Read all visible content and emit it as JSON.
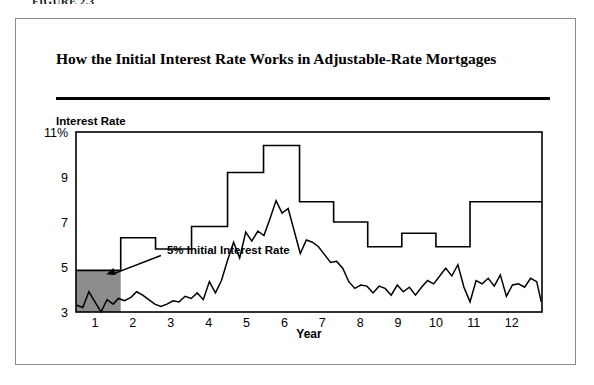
{
  "figure": {
    "caption": "FIGURE 2.3",
    "title": "How the Initial Interest Rate Works in Adjustable-Rate Mortgages",
    "frame_color": "#8a8a8a",
    "rule_color": "#000000"
  },
  "axes": {
    "y_title": "Interest Rate",
    "x_title": "Year",
    "y_ticks": [
      "11%",
      "9",
      "7",
      "5",
      "3"
    ],
    "x_ticks": [
      "1",
      "2",
      "3",
      "4",
      "5",
      "6",
      "7",
      "8",
      "9",
      "10",
      "11",
      "12"
    ]
  },
  "annotation": {
    "label": "5% Initial Interest Rate",
    "shade_color": "#8c8c8c",
    "arrow_color": "#000000"
  },
  "chart_data": {
    "type": "line",
    "title": "How the Initial Interest Rate Works in Adjustable-Rate Mortgages",
    "xlabel": "Year",
    "ylabel": "Interest Rate",
    "xlim": [
      0.5,
      12.8
    ],
    "ylim": [
      3,
      11
    ],
    "grid": false,
    "legend": null,
    "y_tick_values": [
      11,
      9,
      7,
      5,
      3
    ],
    "x_tick_values": [
      1,
      2,
      3,
      4,
      5,
      6,
      7,
      8,
      9,
      10,
      11,
      12
    ],
    "annotations": [
      {
        "text": "5% Initial Interest Rate",
        "x": 2.9,
        "y": 5.6,
        "arrow_to_x": 1.3,
        "arrow_to_y": 4.75
      }
    ],
    "shaded_region": {
      "label": "5% Initial Interest Rate period",
      "x_from": 0.5,
      "x_to": 1.68,
      "y_from": 3.0,
      "y_to": 4.85,
      "color": "#8c8c8c"
    },
    "series": [
      {
        "name": "Mortgage Rate Charged (annual adjustment)",
        "style": "step",
        "step_breaks": [
          0.5,
          1.68,
          2.6,
          3.55,
          4.5,
          5.45,
          6.4,
          7.3,
          8.2,
          9.1,
          10.0,
          10.9,
          11.8,
          12.8
        ],
        "values": [
          4.85,
          6.3,
          5.8,
          6.8,
          9.2,
          10.4,
          7.9,
          7.0,
          5.9,
          6.5,
          5.9,
          7.9,
          7.9
        ]
      },
      {
        "name": "Market Index Rate",
        "style": "jagged-line",
        "x": [
          0.52,
          0.68,
          0.84,
          1.0,
          1.16,
          1.32,
          1.48,
          1.62,
          1.78,
          1.95,
          2.1,
          2.26,
          2.42,
          2.58,
          2.74,
          2.9,
          3.06,
          3.22,
          3.38,
          3.54,
          3.7,
          3.86,
          4.02,
          4.18,
          4.34,
          4.5,
          4.66,
          4.82,
          4.98,
          5.14,
          5.3,
          5.46,
          5.62,
          5.78,
          5.94,
          6.1,
          6.26,
          6.42,
          6.58,
          6.74,
          6.9,
          7.06,
          7.22,
          7.38,
          7.54,
          7.7,
          7.86,
          8.02,
          8.18,
          8.34,
          8.5,
          8.66,
          8.82,
          8.98,
          9.14,
          9.3,
          9.46,
          9.62,
          9.78,
          9.94,
          10.1,
          10.26,
          10.42,
          10.58,
          10.74,
          10.9,
          11.06,
          11.22,
          11.38,
          11.54,
          11.7,
          11.86,
          12.02,
          12.18,
          12.34,
          12.5,
          12.66,
          12.78
        ],
        "values": [
          3.3,
          3.2,
          3.9,
          3.45,
          3.0,
          3.55,
          3.35,
          3.6,
          3.5,
          3.65,
          3.9,
          3.75,
          3.55,
          3.35,
          3.25,
          3.35,
          3.5,
          3.45,
          3.7,
          3.6,
          3.85,
          3.55,
          4.35,
          3.85,
          4.4,
          5.3,
          6.1,
          5.4,
          6.55,
          6.15,
          6.6,
          6.4,
          7.15,
          7.95,
          7.4,
          7.6,
          6.6,
          5.6,
          6.2,
          6.1,
          5.9,
          5.55,
          5.2,
          5.25,
          4.95,
          4.35,
          4.05,
          4.2,
          4.15,
          3.85,
          4.15,
          4.05,
          3.75,
          4.2,
          3.9,
          4.1,
          3.75,
          4.1,
          4.4,
          4.25,
          4.6,
          4.95,
          4.6,
          5.1,
          4.1,
          3.45,
          4.4,
          4.25,
          4.5,
          4.15,
          4.65,
          3.7,
          4.2,
          4.25,
          4.1,
          4.5,
          4.35,
          3.45
        ]
      }
    ]
  }
}
